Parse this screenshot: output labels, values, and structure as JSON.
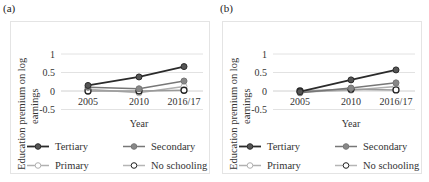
{
  "chart_data": [
    {
      "panel": "(a)",
      "type": "line",
      "title": "",
      "xlabel": "Year",
      "ylabel": "Education premium on log earnings",
      "categories": [
        "2005",
        "2010",
        "2016/17"
      ],
      "ylim": [
        -0.5,
        1
      ],
      "yticks": [
        "1",
        "0.5",
        "0",
        "-0.5"
      ],
      "grid": true,
      "legend_position": "bottom",
      "series": [
        {
          "name": "Tertiary",
          "values": [
            0.15,
            0.38,
            0.66
          ],
          "color": "#2b2b2b",
          "marker_fill": "#555555"
        },
        {
          "name": "Secondary",
          "values": [
            0.1,
            0.06,
            0.27
          ],
          "color": "#777777",
          "marker_fill": "#888888"
        },
        {
          "name": "Primary",
          "values": [
            0.05,
            -0.05,
            0.12
          ],
          "color": "#b0b0b0",
          "marker_fill": "#ffffff"
        },
        {
          "name": "No schooling",
          "values": [
            0.0,
            0.0,
            0.02
          ],
          "color": "#9a9a9a",
          "marker_fill": "#ffffff"
        }
      ]
    },
    {
      "panel": "(b)",
      "type": "line",
      "title": "",
      "xlabel": "Year",
      "ylabel": "Education premium on log earnings",
      "categories": [
        "2005",
        "2010",
        "2016/17"
      ],
      "ylim": [
        -0.5,
        1
      ],
      "yticks": [
        "1",
        "0.5",
        "0",
        "-0.5"
      ],
      "grid": true,
      "legend_position": "bottom",
      "series": [
        {
          "name": "Tertiary",
          "values": [
            -0.02,
            0.3,
            0.57
          ],
          "color": "#2b2b2b",
          "marker_fill": "#555555"
        },
        {
          "name": "Secondary",
          "values": [
            -0.05,
            0.08,
            0.22
          ],
          "color": "#777777",
          "marker_fill": "#888888"
        },
        {
          "name": "Primary",
          "values": [
            -0.03,
            0.02,
            0.12
          ],
          "color": "#b0b0b0",
          "marker_fill": "#ffffff"
        },
        {
          "name": "No schooling",
          "values": [
            0.0,
            0.05,
            0.03
          ],
          "color": "#9a9a9a",
          "marker_fill": "#ffffff"
        }
      ]
    }
  ],
  "panels": [
    {
      "label": "(a)",
      "ylabel_line1": "Education premium on log",
      "ylabel_line2": "earnings",
      "xlabel": "Year"
    },
    {
      "label": "(b)",
      "ylabel_line1": "Education premium on log",
      "ylabel_line2": "earnings",
      "xlabel": "Year"
    }
  ]
}
